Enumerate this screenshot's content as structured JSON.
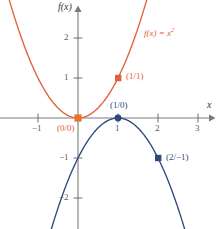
{
  "figure": {
    "background": "#ffffff",
    "width": 219,
    "height": 229
  },
  "axes": {
    "x_axis_name": "x",
    "y_axis_name": "f(x)",
    "x_color": "#7a7a7a",
    "y_color": "#7a7a7a",
    "origin_px": {
      "x": 78,
      "y": 118
    },
    "unit_px": {
      "x": 40,
      "y": 40
    },
    "xlim": [
      -2.0,
      3.5
    ],
    "ylim": [
      -2.8,
      3.0
    ],
    "grid": false,
    "x_ticks": [
      {
        "value": -1,
        "label": "−1"
      },
      {
        "value": 1,
        "label": "1"
      },
      {
        "value": 2,
        "label": "2"
      },
      {
        "value": 3,
        "label": "3"
      }
    ],
    "y_ticks": [
      {
        "value": 2,
        "label": "2"
      },
      {
        "value": 1,
        "label": "1"
      },
      {
        "value": -1,
        "label": "−1"
      },
      {
        "value": -2,
        "label": "−2"
      }
    ]
  },
  "chart_data": {
    "type": "line",
    "title": "",
    "subtitle": "",
    "xlabel": "x",
    "ylabel": "f(x)",
    "xlim": [
      -2.0,
      3.5
    ],
    "ylim": [
      -2.8,
      3.0
    ],
    "grid": false,
    "legend_position": "inline-curve-labels",
    "series": [
      {
        "name": "f(x) = x²",
        "label_text": "f(x) = x",
        "label_exponent": "2",
        "color": "#e2603c",
        "equation": "y = x^2",
        "x": [
          -2.0,
          -1.75,
          -1.5,
          -1.25,
          -1.0,
          -0.75,
          -0.5,
          -0.25,
          0.0,
          0.25,
          0.5,
          0.75,
          1.0,
          1.25,
          1.5,
          1.75
        ],
        "y": [
          4.0,
          3.0625,
          2.25,
          1.5625,
          1.0,
          0.5625,
          0.25,
          0.0625,
          0.0,
          0.0625,
          0.25,
          0.5625,
          1.0,
          1.5625,
          2.25,
          3.0625
        ]
      },
      {
        "name": "g(x) = -(x-1)²",
        "label_text": "",
        "color": "#2e4a7d",
        "equation": "y = -(x-1)^2",
        "x": [
          -0.7,
          -0.5,
          -0.25,
          0.0,
          0.25,
          0.5,
          0.75,
          1.0,
          1.25,
          1.5,
          1.75,
          2.0,
          2.25,
          2.5,
          2.75
        ],
        "y": [
          -2.89,
          -2.25,
          -1.5625,
          -1.0,
          -0.5625,
          -0.25,
          -0.0625,
          0.0,
          -0.0625,
          -0.25,
          -0.5625,
          -1.0,
          -1.5625,
          -2.25,
          -3.0625
        ]
      }
    ],
    "annotations": [
      {
        "id": "pt-orange-origin",
        "x": 0,
        "y": 0,
        "label": "(0/0)",
        "color": "#e2603c",
        "marker": "square",
        "position": "below-left"
      },
      {
        "id": "pt-orange-one",
        "x": 1,
        "y": 1,
        "label": "(1/1)",
        "color": "#e2603c",
        "marker": "square",
        "position": "right"
      },
      {
        "id": "pt-blue-vertex",
        "x": 1,
        "y": 0,
        "label": "(1/0)",
        "color": "#2e4a7d",
        "marker": "circle",
        "position": "above"
      },
      {
        "id": "pt-blue-two",
        "x": 2,
        "y": -1,
        "label": "(2/−1)",
        "color": "#2e4a7d",
        "marker": "square",
        "position": "right"
      }
    ]
  },
  "labels": {
    "curve_orange": "f(x) = x",
    "curve_orange_exp": "2",
    "point_origin": "(0/0)",
    "point_one_one": "(1/1)",
    "point_one_zero": "(1/0)",
    "point_two_minus_one": "(2/−1)",
    "x_axis": "x",
    "y_axis": "f(x)"
  },
  "colors": {
    "orange": "#e2603c",
    "blue": "#2e4a7d",
    "axis": "#7a7a7a",
    "tick_text": "#5a5a5a"
  }
}
